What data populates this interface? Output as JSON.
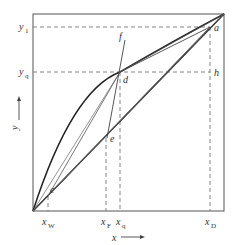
{
  "diagram": {
    "colors": {
      "line": "#222222",
      "thin": "#555555",
      "dash": "#666666",
      "text": "#333333",
      "background": "#ffffff"
    },
    "frame": {
      "left": 33,
      "top": 14,
      "right": 224,
      "bottom": 211
    },
    "axes": {
      "x_label": "x",
      "y_label": "y"
    },
    "y_labels": [
      {
        "id": "y1",
        "main": "y",
        "sub": "1",
        "y": 27
      },
      {
        "id": "yq",
        "main": "y",
        "sub": "q",
        "y": 72
      }
    ],
    "x_labels": [
      {
        "id": "xW",
        "main": "x",
        "sub": "W",
        "x": 48
      },
      {
        "id": "xF",
        "main": "x",
        "sub": "F",
        "x": 106
      },
      {
        "id": "xq",
        "main": "x",
        "sub": "q",
        "x": 120
      },
      {
        "id": "xD",
        "main": "x",
        "sub": "D",
        "x": 210
      }
    ],
    "points": [
      {
        "id": "a",
        "label": "a",
        "x": 210,
        "y": 27
      },
      {
        "id": "d",
        "label": "d",
        "x": 120,
        "y": 72
      },
      {
        "id": "h",
        "label": "h",
        "x": 210,
        "y": 72
      },
      {
        "id": "e",
        "label": "e",
        "x": 107,
        "y": 138
      },
      {
        "id": "c",
        "label": "c",
        "x": 48,
        "y": 196
      },
      {
        "id": "f",
        "label": "f",
        "x": 125,
        "y": 45
      }
    ]
  }
}
